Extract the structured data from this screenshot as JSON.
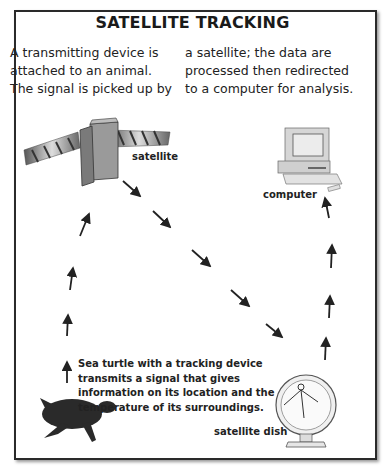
{
  "title": "SATELLITE TRACKING",
  "intro": {
    "left": "A transmitting device is attached to an animal. The signal is picked up by",
    "right": "a satellite; the data are processed then redirected to a computer for analysis."
  },
  "labels": {
    "satellite": "satellite",
    "computer": "computer",
    "satellite_dish": "satellite dish"
  },
  "caption": "Sea turtle with a tracking device transmits a signal that gives information on its location and the temperature of its surroundings.",
  "flow": [
    {
      "from": "sea turtle",
      "to": "satellite",
      "direction": "up"
    },
    {
      "from": "satellite",
      "to": "satellite dish",
      "direction": "down-right"
    },
    {
      "from": "satellite dish",
      "to": "computer",
      "direction": "up"
    }
  ]
}
